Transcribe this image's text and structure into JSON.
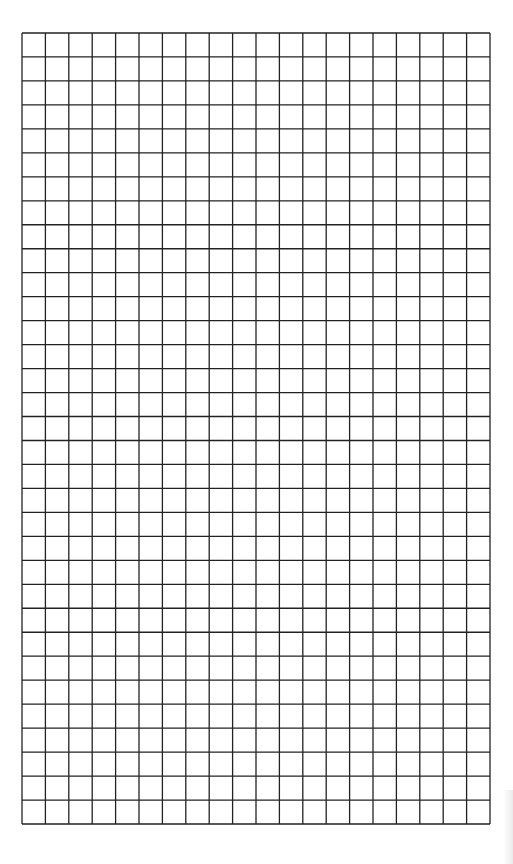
{
  "sheet": {
    "type": "graph-paper",
    "columns": 20,
    "rows": 33,
    "line_color": "#222222",
    "background_color": "#ffffff",
    "line_width": 1.3
  }
}
